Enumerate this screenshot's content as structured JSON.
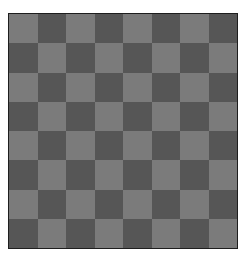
{
  "board": {
    "rows": 8,
    "cols": 8,
    "top_left": "light",
    "colors": {
      "light": "#7b7b7b",
      "dark": "#565656",
      "border": "#1e1e1e"
    },
    "pieces": []
  }
}
